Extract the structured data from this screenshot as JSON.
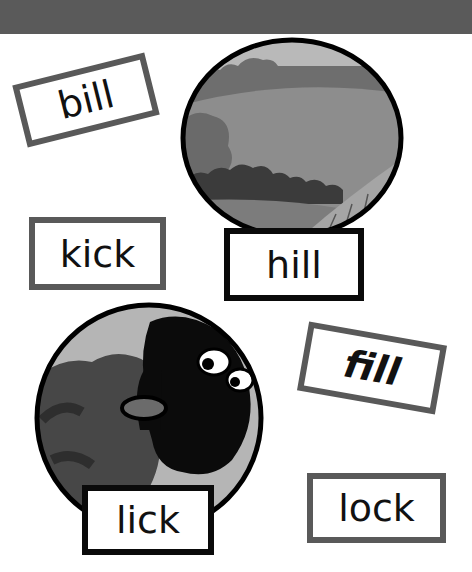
{
  "page": {
    "header_band_color": "#5a5a5a",
    "background": "#ffffff"
  },
  "cards": {
    "bill": {
      "label": "bill",
      "rotation_deg": -14,
      "border": "#595959"
    },
    "kick": {
      "label": "kick",
      "rotation_deg": 0,
      "border": "#595959"
    },
    "hill": {
      "label": "hill",
      "rotation_deg": 0,
      "border": "#0a0a0a"
    },
    "fill": {
      "label": "fill",
      "rotation_deg": 10,
      "border": "#595959"
    },
    "lick": {
      "label": "lick",
      "rotation_deg": 0,
      "border": "#0a0a0a"
    },
    "lock": {
      "label": "lock",
      "rotation_deg": 0,
      "border": "#595959"
    }
  },
  "pictures": {
    "hill": {
      "subject": "hill-landscape-picture"
    },
    "lick": {
      "subject": "sheep-licking-picture"
    }
  }
}
